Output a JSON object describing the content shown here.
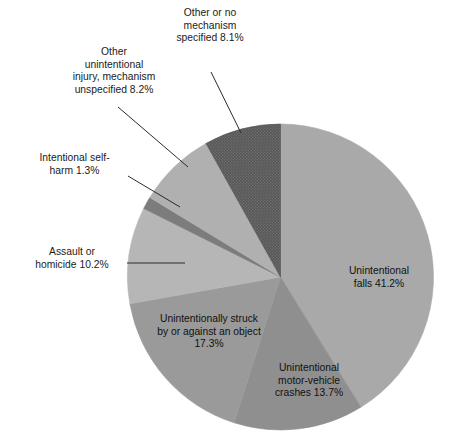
{
  "chart_data": {
    "type": "pie",
    "title": "",
    "subtitle": "",
    "xlabel": "",
    "ylabel": "",
    "legend_position": "none",
    "grid": false,
    "units": "percent",
    "total": 100.0,
    "start_angle_deg": 0,
    "direction": "clockwise",
    "categories": [
      "Unintentional falls",
      "Unintentional motor-vehicle crashes",
      "Unintentionally struck by or against an object",
      "Assault or homicide",
      "Intentional self-harm",
      "Other unintentional injury, mechanism unspecified",
      "Other or no mechanism specified"
    ],
    "values": [
      41.2,
      13.7,
      17.3,
      10.2,
      1.3,
      8.2,
      8.1
    ],
    "slices": [
      {
        "id": "falls",
        "name": "Unintentional falls",
        "value": 41.2,
        "value_label": "41.2%",
        "label_text": "Unintentional\nfalls 41.2%",
        "color": "#a9a9a9",
        "label_placement": "inside",
        "has_leader_line": false,
        "texture": "solid"
      },
      {
        "id": "motor-vehicle",
        "name": "Unintentional motor-vehicle crashes",
        "value": 13.7,
        "value_label": "13.7%",
        "label_text": "Unintentional\nmotor-vehicle\ncrashes 13.7%",
        "color": "#8f8f8f",
        "label_placement": "inside",
        "has_leader_line": false,
        "texture": "solid"
      },
      {
        "id": "struck",
        "name": "Unintentionally struck by or against an object",
        "value": 17.3,
        "value_label": "17.3%",
        "label_text": "Unintentionally struck\nby or against an object\n17.3%",
        "color": "#9a9a9a",
        "label_placement": "inside",
        "has_leader_line": false,
        "texture": "solid"
      },
      {
        "id": "assault",
        "name": "Assault or homicide",
        "value": 10.2,
        "value_label": "10.2%",
        "label_text": "Assault or\nhomicide 10.2%",
        "color": "#b6b6b6",
        "label_placement": "outside",
        "has_leader_line": true,
        "texture": "solid"
      },
      {
        "id": "self-harm",
        "name": "Intentional self-harm",
        "value": 1.3,
        "value_label": "1.3%",
        "label_text": "Intentional self-\nharm 1.3%",
        "color": "#7c7c7c",
        "label_placement": "outside",
        "has_leader_line": true,
        "texture": "solid"
      },
      {
        "id": "other-unintentional",
        "name": "Other unintentional injury, mechanism unspecified",
        "value": 8.2,
        "value_label": "8.2%",
        "label_text": "Other\nunintentional\ninjury, mechanism\nunspecified 8.2%",
        "color": "#b0b0b0",
        "label_placement": "outside",
        "has_leader_line": true,
        "texture": "solid"
      },
      {
        "id": "other-no-mechanism",
        "name": "Other or no mechanism specified",
        "value": 8.1,
        "value_label": "8.1%",
        "label_text": "Other or no\nmechanism\nspecified 8.1%",
        "color": "#5e5e5e",
        "label_placement": "outside",
        "has_leader_line": true,
        "texture": "hatched"
      }
    ]
  },
  "labels": {
    "other_no_mechanism": "Other or no\nmechanism\nspecified 8.1%",
    "other_unintentional": "Other\nunintentional\ninjury, mechanism\nunspecified 8.2%",
    "self_harm": "Intentional self-\nharm 1.3%",
    "assault": "Assault or\nhomicide 10.2%",
    "falls": "Unintentional\nfalls 41.2%",
    "motor_vehicle": "Unintentional\nmotor-vehicle\ncrashes 13.7%",
    "struck": "Unintentionally struck\nby or against an object\n17.3%"
  },
  "colors": {
    "background": "#ffffff",
    "text": "#1a1a1a",
    "leader_line": "#2b2b2b",
    "slice_falls": "#a9a9a9",
    "slice_motor_vehicle": "#8f8f8f",
    "slice_struck": "#9a9a9a",
    "slice_assault": "#b6b6b6",
    "slice_self_harm": "#7c7c7c",
    "slice_other_unintentional": "#b0b0b0",
    "slice_other_no_mechanism": "#5e5e5e"
  }
}
